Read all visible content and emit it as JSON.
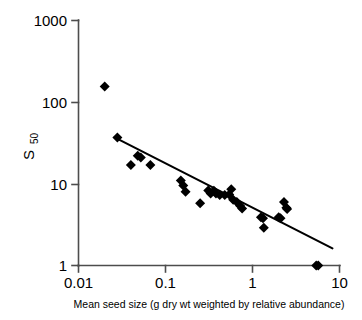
{
  "chart_data": {
    "type": "scatter",
    "title": "",
    "xlabel": "Mean seed size (g dry wt weighted by relative abundance)",
    "ylabel": "S 50",
    "ylabel_base": "S",
    "ylabel_subscript": "50",
    "xscale": "log",
    "yscale": "log",
    "xlim": [
      0.01,
      10
    ],
    "ylim": [
      1,
      1000
    ],
    "grid": false,
    "legend": null,
    "xticks": [
      0.01,
      0.1,
      1,
      10
    ],
    "xtick_labels": [
      "0.01",
      "0.1",
      "1",
      "10"
    ],
    "yticks": [
      1,
      10,
      100,
      1000
    ],
    "ytick_labels": [
      "1",
      "10",
      "100",
      "1000"
    ],
    "marker": "filled-diamond",
    "marker_color": "#000000",
    "series": [
      {
        "name": "sites",
        "points": [
          [
            0.02,
            155
          ],
          [
            0.028,
            37
          ],
          [
            0.04,
            17
          ],
          [
            0.048,
            22
          ],
          [
            0.052,
            21
          ],
          [
            0.067,
            17
          ],
          [
            0.15,
            11
          ],
          [
            0.16,
            9.5
          ],
          [
            0.17,
            8.0
          ],
          [
            0.25,
            5.8
          ],
          [
            0.31,
            8.3
          ],
          [
            0.33,
            7.6
          ],
          [
            0.36,
            8.2
          ],
          [
            0.38,
            7.6
          ],
          [
            0.42,
            7.3
          ],
          [
            0.48,
            7.3
          ],
          [
            0.54,
            7.4
          ],
          [
            0.57,
            8.6
          ],
          [
            0.6,
            6.4
          ],
          [
            0.66,
            6.0
          ],
          [
            0.72,
            5.4
          ],
          [
            0.76,
            5.0
          ],
          [
            1.25,
            3.9
          ],
          [
            1.32,
            3.8
          ],
          [
            1.35,
            2.9
          ],
          [
            2.0,
            3.9
          ],
          [
            2.1,
            3.8
          ],
          [
            2.3,
            6.0
          ],
          [
            2.45,
            5.1
          ],
          [
            2.5,
            4.9
          ],
          [
            5.4,
            1.0
          ],
          [
            5.7,
            1.0
          ]
        ]
      }
    ],
    "trend_line": {
      "type": "power-law-fit",
      "x_start": 0.026,
      "y_start": 37.0,
      "x_end": 8.3,
      "y_end": 1.62
    }
  }
}
